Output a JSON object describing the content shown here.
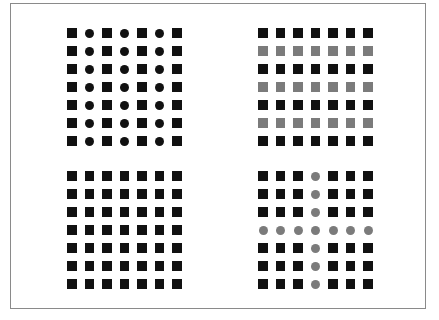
{
  "colors": {
    "black": "#111111",
    "gray": "#7b7b7b",
    "border": "#8a8a8a"
  },
  "panels": [
    {
      "name": "top-left",
      "pos": [
        67,
        28
      ],
      "description": "Columns alternate square and circle, all black",
      "rows": [
        [
          "sq:black",
          "ci:black",
          "sq:black",
          "ci:black",
          "sq:black",
          "ci:black",
          "sq:black"
        ],
        [
          "sq:black",
          "ci:black",
          "sq:black",
          "ci:black",
          "sq:black",
          "ci:black",
          "sq:black"
        ],
        [
          "sq:black",
          "ci:black",
          "sq:black",
          "ci:black",
          "sq:black",
          "ci:black",
          "sq:black"
        ],
        [
          "sq:black",
          "ci:black",
          "sq:black",
          "ci:black",
          "sq:black",
          "ci:black",
          "sq:black"
        ],
        [
          "sq:black",
          "ci:black",
          "sq:black",
          "ci:black",
          "sq:black",
          "ci:black",
          "sq:black"
        ],
        [
          "sq:black",
          "ci:black",
          "sq:black",
          "ci:black",
          "sq:black",
          "ci:black",
          "sq:black"
        ],
        [
          "sq:black",
          "ci:black",
          "sq:black",
          "ci:black",
          "sq:black",
          "ci:black",
          "sq:black"
        ]
      ]
    },
    {
      "name": "top-right",
      "pos": [
        258,
        28
      ],
      "description": "All squares, rows alternate black and gray",
      "rows": [
        [
          "sq:black",
          "sq:black",
          "sq:black",
          "sq:black",
          "sq:black",
          "sq:black",
          "sq:black"
        ],
        [
          "sq:gray",
          "sq:gray",
          "sq:gray",
          "sq:gray",
          "sq:gray",
          "sq:gray",
          "sq:gray"
        ],
        [
          "sq:black",
          "sq:black",
          "sq:black",
          "sq:black",
          "sq:black",
          "sq:black",
          "sq:black"
        ],
        [
          "sq:gray",
          "sq:gray",
          "sq:gray",
          "sq:gray",
          "sq:gray",
          "sq:gray",
          "sq:gray"
        ],
        [
          "sq:black",
          "sq:black",
          "sq:black",
          "sq:black",
          "sq:black",
          "sq:black",
          "sq:black"
        ],
        [
          "sq:gray",
          "sq:gray",
          "sq:gray",
          "sq:gray",
          "sq:gray",
          "sq:gray",
          "sq:gray"
        ],
        [
          "sq:black",
          "sq:black",
          "sq:black",
          "sq:black",
          "sq:black",
          "sq:black",
          "sq:black"
        ]
      ]
    },
    {
      "name": "bottom-left",
      "pos": [
        67,
        171
      ],
      "description": "All black squares",
      "rows": [
        [
          "sq:black",
          "sq:black",
          "sq:black",
          "sq:black",
          "sq:black",
          "sq:black",
          "sq:black"
        ],
        [
          "sq:black",
          "sq:black",
          "sq:black",
          "sq:black",
          "sq:black",
          "sq:black",
          "sq:black"
        ],
        [
          "sq:black",
          "sq:black",
          "sq:black",
          "sq:black",
          "sq:black",
          "sq:black",
          "sq:black"
        ],
        [
          "sq:black",
          "sq:black",
          "sq:black",
          "sq:black",
          "sq:black",
          "sq:black",
          "sq:black"
        ],
        [
          "sq:black",
          "sq:black",
          "sq:black",
          "sq:black",
          "sq:black",
          "sq:black",
          "sq:black"
        ],
        [
          "sq:black",
          "sq:black",
          "sq:black",
          "sq:black",
          "sq:black",
          "sq:black",
          "sq:black"
        ],
        [
          "sq:black",
          "sq:black",
          "sq:black",
          "sq:black",
          "sq:black",
          "sq:black",
          "sq:black"
        ]
      ]
    },
    {
      "name": "bottom-right",
      "pos": [
        258,
        171
      ],
      "description": "Black squares with a cross of gray circles along middle row and column",
      "rows": [
        [
          "sq:black",
          "sq:black",
          "sq:black",
          "ci:gray",
          "sq:black",
          "sq:black",
          "sq:black"
        ],
        [
          "sq:black",
          "sq:black",
          "sq:black",
          "ci:gray",
          "sq:black",
          "sq:black",
          "sq:black"
        ],
        [
          "sq:black",
          "sq:black",
          "sq:black",
          "ci:gray",
          "sq:black",
          "sq:black",
          "sq:black"
        ],
        [
          "ci:gray",
          "ci:gray",
          "ci:gray",
          "ci:gray",
          "ci:gray",
          "ci:gray",
          "ci:gray"
        ],
        [
          "sq:black",
          "sq:black",
          "sq:black",
          "ci:gray",
          "sq:black",
          "sq:black",
          "sq:black"
        ],
        [
          "sq:black",
          "sq:black",
          "sq:black",
          "ci:gray",
          "sq:black",
          "sq:black",
          "sq:black"
        ],
        [
          "sq:black",
          "sq:black",
          "sq:black",
          "ci:gray",
          "sq:black",
          "sq:black",
          "sq:black"
        ]
      ]
    }
  ]
}
